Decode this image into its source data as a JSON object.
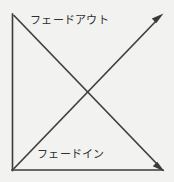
{
  "diagram": {
    "title": "",
    "background_color": "#f2f2f0",
    "line_color": "#3a3a3a",
    "text_color": "#2f2f2f",
    "labels": {
      "fade_out": "フェードアウト",
      "fade_in": "フェードイン"
    },
    "axes": {
      "vertical_name": "vertical-axis",
      "horizontal_name": "horizontal-axis",
      "origin": "bottom-left"
    },
    "curves": [
      {
        "name": "fade-out-curve",
        "label": "フェードアウト",
        "direction": "descending",
        "from": "top-left",
        "to": "bottom-right",
        "arrow": "bottom-right"
      },
      {
        "name": "fade-in-curve",
        "label": "フェードイン",
        "direction": "ascending",
        "from": "bottom-left",
        "to": "top-right",
        "arrow": "top-right"
      }
    ]
  }
}
